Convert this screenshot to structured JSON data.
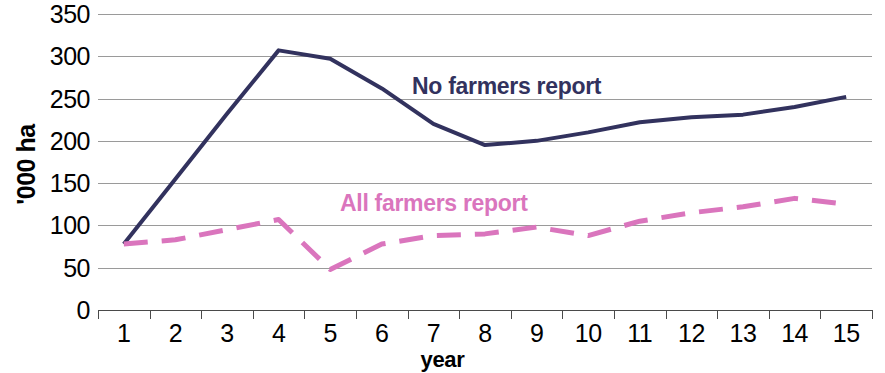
{
  "chart_data": {
    "type": "line",
    "title": "",
    "xlabel": "year",
    "ylabel": "'000 ha",
    "x": [
      1,
      2,
      3,
      4,
      5,
      6,
      7,
      8,
      9,
      10,
      11,
      12,
      13,
      14,
      15
    ],
    "categories": [
      "1",
      "2",
      "3",
      "4",
      "5",
      "6",
      "7",
      "8",
      "9",
      "10",
      "11",
      "12",
      "13",
      "14",
      "15"
    ],
    "ylim": [
      0,
      350
    ],
    "y_ticks": [
      0,
      50,
      100,
      150,
      200,
      250,
      300,
      350
    ],
    "y_tick_labels": [
      "0",
      "50",
      "100",
      "150",
      "200",
      "250",
      "300",
      "350"
    ],
    "grid": true,
    "legend_position": "inline-annotations",
    "series": [
      {
        "name": "No farmers report",
        "color": "#32325e",
        "style": "solid",
        "values": [
          78,
          155,
          232,
          307,
          297,
          262,
          220,
          195,
          200,
          210,
          222,
          228,
          231,
          240,
          252
        ]
      },
      {
        "name": "All farmers report",
        "color": "#da75bd",
        "style": "dashed",
        "values": [
          78,
          83,
          95,
          107,
          48,
          78,
          88,
          90,
          98,
          88,
          105,
          115,
          122,
          132,
          125
        ]
      }
    ],
    "annotations": [
      {
        "text": "No farmers report",
        "series": "No farmers report",
        "color": "#32325e"
      },
      {
        "text": "All farmers report",
        "series": "All farmers report",
        "color": "#da75bd"
      }
    ]
  },
  "axes": {
    "y_title": "'000 ha",
    "x_title": "year"
  },
  "colors": {
    "no_farmers": "#32325e",
    "all_farmers": "#da75bd",
    "gridline": "#9a9a9a",
    "axis": "#4a4a4a",
    "background": "#ffffff"
  }
}
